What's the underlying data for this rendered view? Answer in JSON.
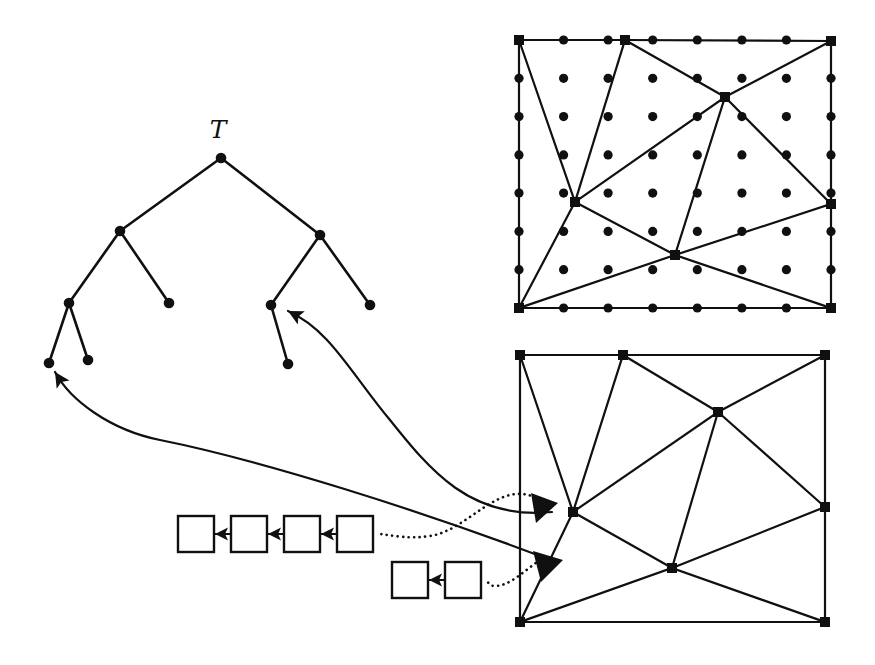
{
  "figure": {
    "background_color": "#ffffff",
    "ink_color": "#101010",
    "width": 875,
    "height": 665
  },
  "tree": {
    "label": "ᵏ",
    "label_text": "T",
    "label_position": {
      "x": 218,
      "y": 138
    },
    "description": "Binary tree T with root at top and eight nodes",
    "nodes": [
      {
        "id": "root",
        "name": "root-node",
        "x": 221,
        "y": 158
      },
      {
        "id": "n1",
        "name": "left-child-node",
        "x": 120,
        "y": 231
      },
      {
        "id": "n2",
        "name": "right-child-node",
        "x": 320,
        "y": 235
      },
      {
        "id": "n3",
        "name": "left-left-node",
        "x": 69,
        "y": 303
      },
      {
        "id": "n4",
        "name": "left-right-leaf",
        "x": 169,
        "y": 303
      },
      {
        "id": "n5",
        "name": "right-left-node",
        "x": 271,
        "y": 305
      },
      {
        "id": "n6",
        "name": "right-right-leaf",
        "x": 370,
        "y": 305
      },
      {
        "id": "n7",
        "name": "deep-left-leaf",
        "x": 49,
        "y": 363
      },
      {
        "id": "n8",
        "name": "deep-mid-leaf",
        "x": 88,
        "y": 360
      },
      {
        "id": "n9",
        "name": "deep-right-leaf",
        "x": 288,
        "y": 364
      }
    ],
    "edges": [
      {
        "from": "root",
        "to": "n1"
      },
      {
        "from": "root",
        "to": "n2"
      },
      {
        "from": "n1",
        "to": "n3"
      },
      {
        "from": "n1",
        "to": "n4"
      },
      {
        "from": "n2",
        "to": "n5"
      },
      {
        "from": "n2",
        "to": "n6"
      },
      {
        "from": "n3",
        "to": "n7"
      },
      {
        "from": "n3",
        "to": "n8"
      },
      {
        "from": "n5",
        "to": "n9"
      }
    ]
  },
  "mesh_top": {
    "name": "top-mesh-with-grid-points",
    "square": {
      "x1": 519,
      "y1": 40,
      "x2": 831,
      "y2": 308
    },
    "has_grid_dots": true,
    "grid_dot_rows": 6,
    "grid_dot_cols": 6,
    "vertices": [
      {
        "id": "TL",
        "x": 519,
        "y": 40,
        "name": "corner-top-left"
      },
      {
        "id": "TM",
        "x": 625,
        "y": 40,
        "name": "boundary-top-mid"
      },
      {
        "id": "TR",
        "x": 831,
        "y": 41,
        "name": "corner-top-right"
      },
      {
        "id": "RM",
        "x": 831,
        "y": 204,
        "name": "boundary-right-mid"
      },
      {
        "id": "BR",
        "x": 831,
        "y": 308,
        "name": "corner-bottom-right"
      },
      {
        "id": "BL",
        "x": 519,
        "y": 308,
        "name": "corner-bottom-left"
      },
      {
        "id": "IA",
        "x": 725,
        "y": 97,
        "name": "interior-vertex-upper"
      },
      {
        "id": "IB",
        "x": 575,
        "y": 202,
        "name": "interior-vertex-left"
      },
      {
        "id": "IC",
        "x": 675,
        "y": 255,
        "name": "interior-vertex-lower"
      }
    ],
    "edges": [
      {
        "from": "TL",
        "to": "TM"
      },
      {
        "from": "TM",
        "to": "TR"
      },
      {
        "from": "TR",
        "to": "RM"
      },
      {
        "from": "RM",
        "to": "BR"
      },
      {
        "from": "BR",
        "to": "BL"
      },
      {
        "from": "BL",
        "to": "TL"
      },
      {
        "from": "TL",
        "to": "IB"
      },
      {
        "from": "TM",
        "to": "IB"
      },
      {
        "from": "TM",
        "to": "IA"
      },
      {
        "from": "TR",
        "to": "IA"
      },
      {
        "from": "IA",
        "to": "IB"
      },
      {
        "from": "IA",
        "to": "IC"
      },
      {
        "from": "IA",
        "to": "RM"
      },
      {
        "from": "RM",
        "to": "IC"
      },
      {
        "from": "IB",
        "to": "IC"
      },
      {
        "from": "IB",
        "to": "BL"
      },
      {
        "from": "IC",
        "to": "BL"
      },
      {
        "from": "IC",
        "to": "BR"
      }
    ]
  },
  "mesh_bottom": {
    "name": "bottom-mesh-highlighted",
    "square": {
      "x1": 520,
      "y1": 355,
      "x2": 825,
      "y2": 622
    },
    "has_grid_dots": false,
    "vertices": [
      {
        "id": "TL",
        "x": 520,
        "y": 355,
        "name": "corner-top-left"
      },
      {
        "id": "TM",
        "x": 623,
        "y": 355,
        "name": "boundary-top-mid"
      },
      {
        "id": "TR",
        "x": 825,
        "y": 355,
        "name": "corner-top-right"
      },
      {
        "id": "RM",
        "x": 825,
        "y": 507,
        "name": "boundary-right-mid"
      },
      {
        "id": "BR",
        "x": 825,
        "y": 622,
        "name": "corner-bottom-right"
      },
      {
        "id": "BL",
        "x": 520,
        "y": 622,
        "name": "corner-bottom-left"
      },
      {
        "id": "IA",
        "x": 718,
        "y": 412,
        "name": "interior-vertex-upper"
      },
      {
        "id": "IB",
        "x": 573,
        "y": 512,
        "name": "interior-vertex-left"
      },
      {
        "id": "IC",
        "x": 672,
        "y": 568,
        "name": "interior-vertex-lower"
      }
    ],
    "edges": [
      {
        "from": "TL",
        "to": "TM"
      },
      {
        "from": "TM",
        "to": "TR"
      },
      {
        "from": "TR",
        "to": "RM"
      },
      {
        "from": "RM",
        "to": "BR"
      },
      {
        "from": "BR",
        "to": "BL"
      },
      {
        "from": "BL",
        "to": "TL"
      },
      {
        "from": "TL",
        "to": "IB"
      },
      {
        "from": "TM",
        "to": "IB"
      },
      {
        "from": "TM",
        "to": "IA"
      },
      {
        "from": "TR",
        "to": "IA"
      },
      {
        "from": "IA",
        "to": "IB"
      },
      {
        "from": "IA",
        "to": "IC"
      },
      {
        "from": "IA",
        "to": "RM"
      },
      {
        "from": "RM",
        "to": "IC"
      },
      {
        "from": "IB",
        "to": "IC"
      },
      {
        "from": "IB",
        "to": "BL"
      },
      {
        "from": "IC",
        "to": "BL"
      },
      {
        "from": "IC",
        "to": "BR"
      }
    ],
    "filled_triangles": [
      {
        "name": "highlighted-triangle-upper",
        "points": "531,493 558,503 536,523"
      },
      {
        "name": "highlighted-triangle-lower",
        "points": "533,551 563,560 541,582"
      }
    ]
  },
  "list_upper": {
    "name": "upper-linked-list",
    "box_count": 4,
    "boxes": [
      {
        "name": "list-box",
        "x": 178,
        "y": 516,
        "w": 36,
        "h": 36,
        "label": ""
      },
      {
        "name": "list-box",
        "x": 231,
        "y": 516,
        "w": 36,
        "h": 36,
        "label": ""
      },
      {
        "name": "list-box",
        "x": 284,
        "y": 516,
        "w": 36,
        "h": 36,
        "label": ""
      },
      {
        "name": "list-box",
        "x": 337,
        "y": 516,
        "w": 36,
        "h": 36,
        "label": ""
      }
    ],
    "arrow_direction": "right-to-left"
  },
  "list_lower": {
    "name": "lower-linked-list",
    "box_count": 2,
    "boxes": [
      {
        "name": "list-box",
        "x": 392,
        "y": 562,
        "w": 36,
        "h": 36,
        "label": ""
      },
      {
        "name": "list-box",
        "x": 445,
        "y": 562,
        "w": 36,
        "h": 36,
        "label": ""
      }
    ],
    "arrow_direction": "right-to-left"
  },
  "connectors": {
    "solid_curves": [
      {
        "name": "curve-mesh-to-tree-node-upper",
        "description": "solid arrow from bottom mesh region to tree node n5",
        "path": "M 552 512 C 470 520, 430 470, 390 420 C 350 372, 330 330, 288 311",
        "arrow_at": {
          "x": 288,
          "y": 311
        }
      },
      {
        "name": "curve-mesh-to-tree-node-lower",
        "description": "solid arrow from bottom mesh region to tree leaf n7",
        "path": "M 556 562 C 420 510, 260 460, 160 440 C 110 430, 70 400, 55 372",
        "arrow_at": {
          "x": 55,
          "y": 372
        }
      }
    ],
    "dotted_curves": [
      {
        "name": "dotted-curve-upper-list-to-triangle",
        "description": "dotted connector from upper list right box to upper highlighted triangle",
        "path": "M 540 500 C 500 476, 470 530, 430 536 C 410 539, 395 536, 380 534"
      },
      {
        "name": "dotted-curve-lower-list-to-triangle",
        "description": "dotted connector from lower list right box to lower highlighted triangle",
        "path": "M 540 560 C 525 570, 510 586, 495 586 C 490 586, 488 583, 487 580"
      }
    ]
  }
}
